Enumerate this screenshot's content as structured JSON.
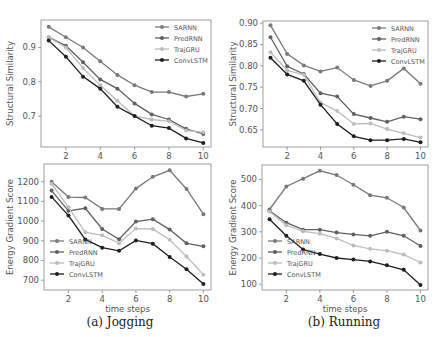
{
  "colors": {
    "SARNN": "#7a7a7a",
    "PredRNN": "#616161",
    "TrajGRU": "#bdbdbd",
    "ConvLSTM": "#1f1f1f"
  },
  "captions": {
    "a": "(a) Jogging",
    "b": "(b) Running"
  },
  "chart_data": [
    {
      "id": "jog_ssim",
      "type": "line",
      "panel": "top-left",
      "title": "",
      "xlabel": "",
      "ylabel": "Structural Similarity",
      "x": [
        1,
        2,
        3,
        4,
        5,
        6,
        7,
        8,
        9,
        10
      ],
      "xticks": [
        2,
        4,
        6,
        8,
        10
      ],
      "yticks": [
        0.7,
        0.8,
        0.9
      ],
      "ytick_labels": [
        "0.7",
        "0.8",
        "0.9"
      ],
      "ylim": [
        0.61,
        0.98
      ],
      "legend_position": "upper right",
      "series": [
        {
          "name": "SARNN",
          "values": [
            0.96,
            0.93,
            0.9,
            0.86,
            0.82,
            0.79,
            0.77,
            0.77,
            0.757,
            0.765
          ]
        },
        {
          "name": "PredRNN",
          "values": [
            0.93,
            0.905,
            0.857,
            0.807,
            0.78,
            0.737,
            0.705,
            0.69,
            0.663,
            0.648
          ]
        },
        {
          "name": "TrajGRU",
          "values": [
            0.93,
            0.9,
            0.84,
            0.79,
            0.745,
            0.7,
            0.69,
            0.685,
            0.658,
            0.653
          ]
        },
        {
          "name": "ConvLSTM",
          "values": [
            0.92,
            0.873,
            0.815,
            0.78,
            0.727,
            0.7,
            0.672,
            0.665,
            0.635,
            0.622
          ]
        }
      ]
    },
    {
      "id": "run_ssim",
      "type": "line",
      "panel": "top-right",
      "title": "",
      "xlabel": "",
      "ylabel": "Structural Similarity",
      "x": [
        1,
        2,
        3,
        4,
        5,
        6,
        7,
        8,
        9,
        10
      ],
      "xticks": [
        2,
        4,
        6,
        8,
        10
      ],
      "yticks": [
        0.65,
        0.7,
        0.75,
        0.8,
        0.85,
        0.9
      ],
      "ytick_labels": [
        "0.65",
        "0.70",
        "0.75",
        "0.80",
        "0.85",
        "0.90"
      ],
      "ylim": [
        0.61,
        0.905
      ],
      "legend_position": "upper right",
      "series": [
        {
          "name": "SARNN",
          "values": [
            0.895,
            0.828,
            0.801,
            0.787,
            0.796,
            0.767,
            0.753,
            0.765,
            0.794,
            0.758
          ]
        },
        {
          "name": "PredRNN",
          "values": [
            0.867,
            0.799,
            0.781,
            0.736,
            0.728,
            0.687,
            0.678,
            0.669,
            0.681,
            0.675
          ]
        },
        {
          "name": "TrajGRU",
          "values": [
            0.832,
            0.789,
            0.779,
            0.714,
            0.694,
            0.664,
            0.665,
            0.652,
            0.642,
            0.632
          ]
        },
        {
          "name": "ConvLSTM",
          "values": [
            0.819,
            0.78,
            0.765,
            0.709,
            0.664,
            0.635,
            0.626,
            0.626,
            0.629,
            0.621
          ]
        }
      ]
    },
    {
      "id": "jog_egs",
      "type": "line",
      "panel": "bottom-left",
      "title": "",
      "xlabel": "time steps",
      "ylabel": "Energy Gradient Score",
      "x": [
        1,
        2,
        3,
        4,
        5,
        6,
        7,
        8,
        9,
        10
      ],
      "xticks": [
        2,
        4,
        6,
        8,
        10
      ],
      "yticks": [
        700,
        800,
        900,
        1000,
        1100,
        1200
      ],
      "ytick_labels": [
        "700",
        "800",
        "900",
        "1000",
        "1100",
        "1200"
      ],
      "ylim": [
        650,
        1290
      ],
      "legend_position": "lower left",
      "series": [
        {
          "name": "SARNN",
          "values": [
            1200,
            1122,
            1120,
            1062,
            1062,
            1165,
            1225,
            1258,
            1163,
            1035
          ]
        },
        {
          "name": "PredRNN",
          "values": [
            1155,
            1052,
            1065,
            960,
            908,
            998,
            1010,
            957,
            887,
            872
          ]
        },
        {
          "name": "TrajGRU",
          "values": [
            1190,
            1070,
            943,
            928,
            888,
            962,
            960,
            905,
            820,
            728
          ]
        },
        {
          "name": "ConvLSTM",
          "values": [
            1123,
            1028,
            907,
            865,
            849,
            902,
            885,
            818,
            755,
            680
          ]
        }
      ]
    },
    {
      "id": "run_egs",
      "type": "line",
      "panel": "bottom-right",
      "title": "",
      "xlabel": "time steps",
      "ylabel": "Energy Gradient Score",
      "x": [
        1,
        2,
        3,
        4,
        5,
        6,
        7,
        8,
        9,
        10
      ],
      "xticks": [
        2,
        4,
        6,
        8,
        10
      ],
      "yticks": [
        100,
        200,
        300,
        400,
        500
      ],
      "ytick_labels": [
        "100",
        "200",
        "300",
        "400",
        "500"
      ],
      "ylim": [
        78,
        555
      ],
      "legend_position": "lower left",
      "series": [
        {
          "name": "SARNN",
          "values": [
            385,
            473,
            503,
            533,
            517,
            480,
            440,
            430,
            393,
            305
          ]
        },
        {
          "name": "PredRNN",
          "values": [
            380,
            335,
            308,
            308,
            297,
            290,
            285,
            300,
            285,
            246
          ]
        },
        {
          "name": "TrajGRU",
          "values": [
            378,
            325,
            302,
            293,
            275,
            248,
            235,
            228,
            213,
            183
          ]
        },
        {
          "name": "ConvLSTM",
          "values": [
            348,
            285,
            233,
            215,
            200,
            194,
            187,
            172,
            155,
            97
          ]
        }
      ]
    }
  ]
}
